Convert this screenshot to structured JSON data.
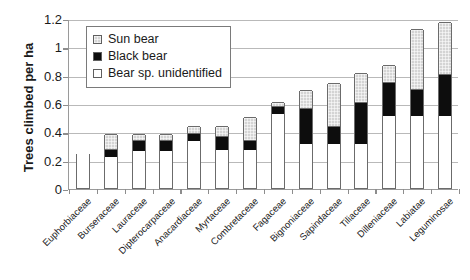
{
  "chart_data": {
    "type": "bar",
    "title": "",
    "subtitle": "",
    "stacked": true,
    "xlabel": "",
    "ylabel": "Trees climbed per ha",
    "ylim": [
      0,
      1.2
    ],
    "yticks": [
      0,
      0.2,
      0.4,
      0.6,
      0.8,
      1,
      1.2
    ],
    "ytick_labels": [
      "0",
      "0.2",
      "0.4",
      "0.6",
      "0.8",
      "1",
      "1.2"
    ],
    "grid": true,
    "legend_position": "upper left",
    "categories": [
      "Euphorbiaceae",
      "Burseraceae",
      "Lauraceae",
      "Dipterocarpaceae",
      "Anacardiaceae",
      "Myrtaceae",
      "Combretaceae",
      "Fagaceae",
      "Bignoniaceae",
      "Sapindaceae",
      "Tiliaceae",
      "Dilleniaceae",
      "Labiatae",
      "Leguminosae"
    ],
    "series": [
      {
        "name": "Bear sp. unidentified",
        "color": "#ffffff",
        "values": [
          0.25,
          0.22,
          0.26,
          0.26,
          0.33,
          0.27,
          0.27,
          0.52,
          0.31,
          0.31,
          0.31,
          0.51,
          0.51,
          0.51
        ]
      },
      {
        "name": "Black bear",
        "color": "#0d0d0d",
        "values": [
          0.0,
          0.05,
          0.07,
          0.07,
          0.05,
          0.09,
          0.06,
          0.05,
          0.25,
          0.12,
          0.29,
          0.23,
          0.18,
          0.29
        ]
      },
      {
        "name": "Sun bear",
        "color": "#d4d4d4",
        "values": [
          0.0,
          0.11,
          0.05,
          0.05,
          0.06,
          0.08,
          0.17,
          0.04,
          0.13,
          0.31,
          0.21,
          0.13,
          0.43,
          0.37
        ]
      }
    ],
    "totals": [
      0.25,
      0.38,
      0.38,
      0.38,
      0.44,
      0.44,
      0.5,
      0.61,
      0.69,
      0.74,
      0.81,
      0.87,
      1.12,
      1.17
    ]
  },
  "legend": {
    "entries": [
      {
        "label": "Sun bear",
        "swatch": "sun"
      },
      {
        "label": "Black bear",
        "swatch": "black"
      },
      {
        "label": "Bear sp. unidentified",
        "swatch": "unid"
      }
    ]
  }
}
